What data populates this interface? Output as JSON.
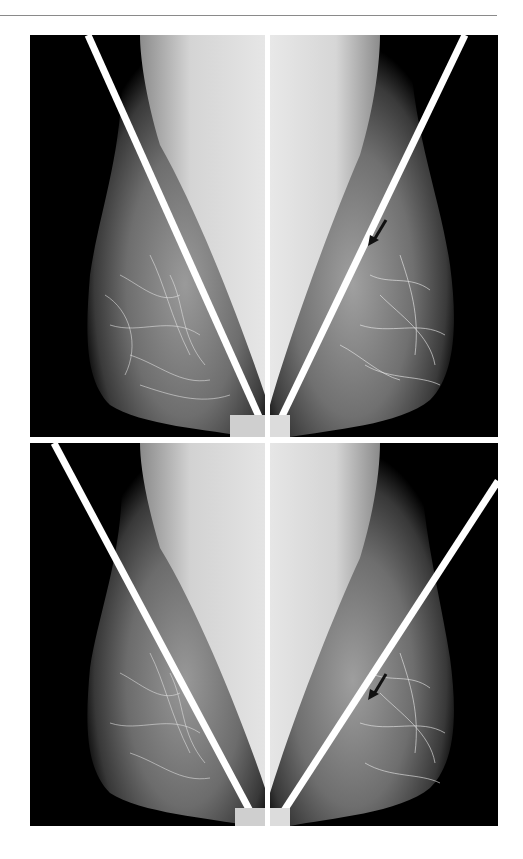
{
  "figure": {
    "type": "mammogram comparison grid",
    "layout": {
      "rows": 2,
      "cols": 2
    },
    "colors": {
      "background": "#000000",
      "guide_line": "#ffffff",
      "divider": "#ffffff",
      "top_rule": "#8a8a8a",
      "arrow": "#111111"
    },
    "panels": [
      {
        "id": "top-left",
        "view": "left breast MLO",
        "guide_line": "diagonal",
        "arrow": false
      },
      {
        "id": "top-right",
        "view": "right breast MLO",
        "guide_line": "diagonal",
        "arrow": true
      },
      {
        "id": "bottom-left",
        "view": "left breast MLO",
        "guide_line": "diagonal",
        "arrow": false
      },
      {
        "id": "bottom-right",
        "view": "right breast MLO",
        "guide_line": "diagonal",
        "arrow": true
      }
    ],
    "annotations": [
      {
        "type": "arrow-icon",
        "panel": "top-right",
        "direction": "down-left"
      },
      {
        "type": "arrow-icon",
        "panel": "bottom-right",
        "direction": "down-left"
      }
    ]
  }
}
